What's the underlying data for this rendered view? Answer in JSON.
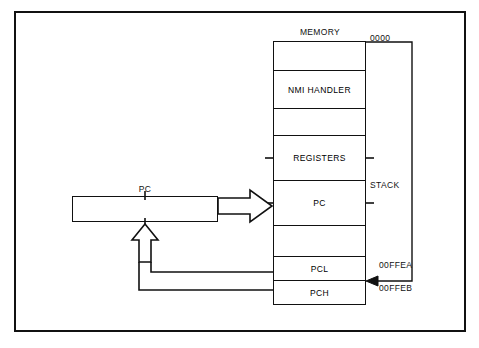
{
  "diagram": {
    "title": "MEMORY",
    "memory_column": {
      "label": "MEMORY",
      "cells": [
        {
          "label": "",
          "name": "memory-cell-empty-top"
        },
        {
          "label": "NMI HANDLER",
          "name": "memory-cell-nmi-handler"
        },
        {
          "label": "",
          "name": "memory-cell-empty-2"
        },
        {
          "label": "REGISTERS",
          "name": "memory-cell-registers"
        },
        {
          "label": "PC",
          "name": "memory-cell-pc"
        },
        {
          "label": "",
          "name": "memory-cell-empty-3"
        },
        {
          "label": "PCL",
          "name": "memory-cell-pcl"
        },
        {
          "label": "PCH",
          "name": "memory-cell-pch"
        }
      ]
    },
    "addresses": {
      "top": "0000",
      "pcl": "00FFEA",
      "pch": "00FFEB"
    },
    "stack_label": "STACK",
    "register": {
      "label": "PC"
    },
    "colors": {
      "ink": "#111111",
      "background": "#ffffff"
    }
  }
}
